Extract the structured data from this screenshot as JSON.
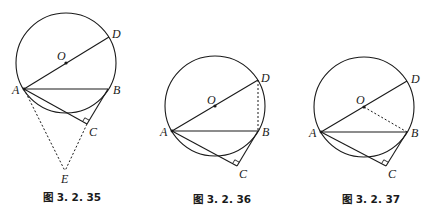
{
  "figures": [
    {
      "caption": "图 3. 2. 35",
      "labels": {
        "O": "O",
        "D": "D",
        "A": "A",
        "B": "B",
        "C": "C",
        "E": "E"
      },
      "circle": {
        "cx": 66,
        "cy": 63,
        "r": 50
      },
      "points": {
        "A": [
          24,
          89
        ],
        "B": [
          108,
          89
        ],
        "C": [
          87,
          124
        ],
        "D": [
          109,
          37
        ],
        "O": [
          66,
          63
        ],
        "E": [
          65,
          171
        ]
      },
      "dotted_segments": [
        [
          "A",
          "E"
        ],
        [
          "C",
          "E"
        ]
      ]
    },
    {
      "caption": "图 3. 2. 36",
      "labels": {
        "O": "O",
        "D": "D",
        "A": "A",
        "B": "B",
        "C": "C"
      },
      "circle": {
        "cx": 215,
        "cy": 106,
        "r": 50
      },
      "points": {
        "A": [
          172,
          131
        ],
        "B": [
          258,
          131
        ],
        "C": [
          237,
          166
        ],
        "D": [
          258,
          80
        ],
        "O": [
          215,
          106
        ]
      },
      "dotted_segments": [
        [
          "D",
          "B"
        ]
      ]
    },
    {
      "caption": "图 3. 2. 37",
      "labels": {
        "O": "O",
        "D": "D",
        "A": "A",
        "B": "B",
        "C": "C"
      },
      "circle": {
        "cx": 364,
        "cy": 107,
        "r": 50
      },
      "points": {
        "A": [
          321,
          132
        ],
        "B": [
          407,
          132
        ],
        "C": [
          386,
          166
        ],
        "D": [
          407,
          81
        ],
        "O": [
          364,
          107
        ]
      },
      "dotted_segments": [
        [
          "O",
          "B"
        ]
      ]
    }
  ]
}
